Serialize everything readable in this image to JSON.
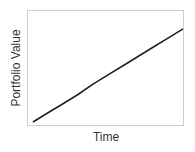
{
  "chart_data": {
    "type": "line",
    "title": "",
    "xlabel": "Time",
    "ylabel": "Portfolio Value",
    "x": [
      0,
      1,
      2,
      3,
      4,
      5,
      6,
      7,
      8,
      9,
      10
    ],
    "series": [
      {
        "name": "Portfolio Value",
        "values": [
          0.03,
          0.11,
          0.19,
          0.27,
          0.36,
          0.44,
          0.52,
          0.6,
          0.68,
          0.76,
          0.84
        ]
      }
    ],
    "xlim": [
      0,
      10
    ],
    "ylim": [
      0,
      1
    ],
    "grid": false,
    "ticks": false,
    "legend": null,
    "colors": {
      "line": "#222222",
      "frame": "#cccccc"
    }
  }
}
